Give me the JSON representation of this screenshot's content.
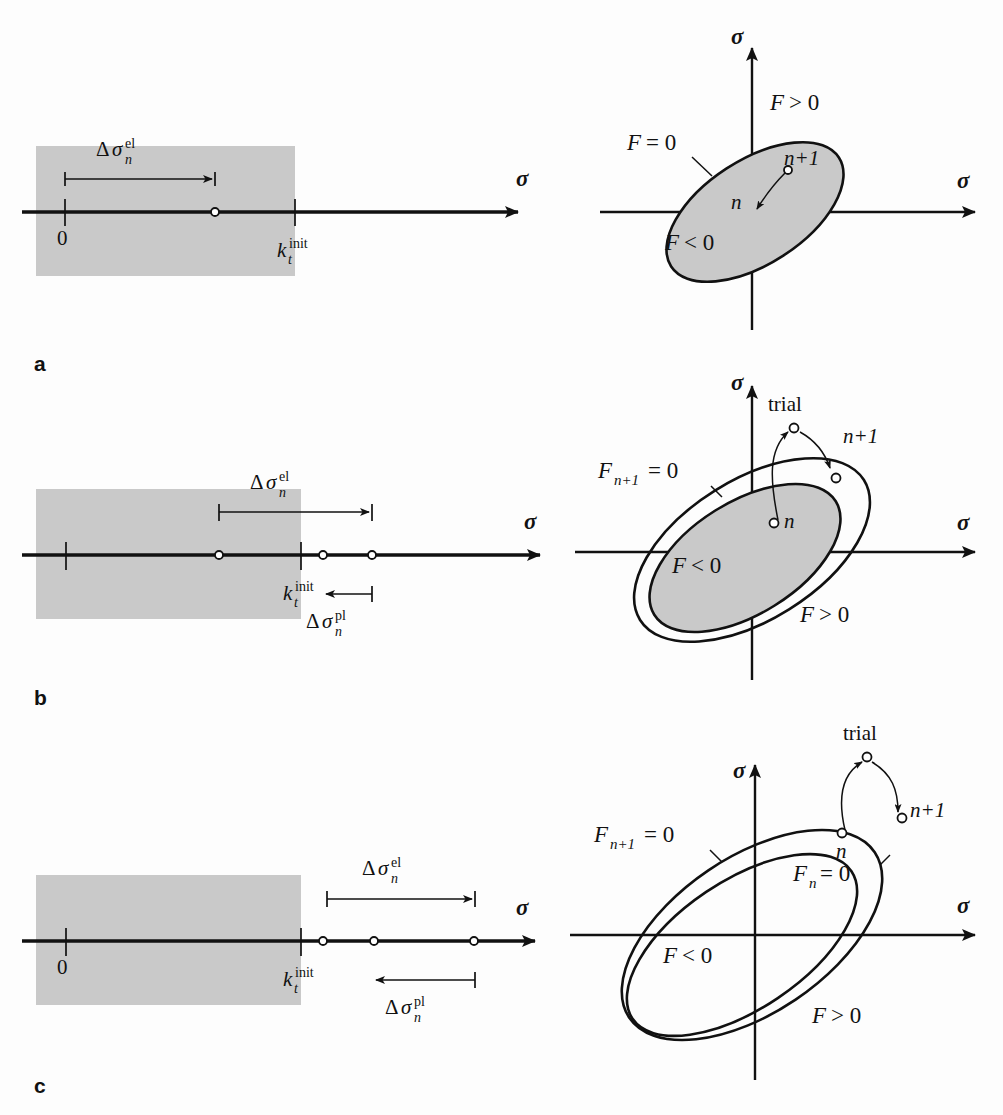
{
  "figure": {
    "background_color": "#fdfdfd",
    "shade_color": "#c9c9c9",
    "line_color": "#111111",
    "panels": [
      {
        "id": "a",
        "letter": "a",
        "left": {
          "axis_label": "σ",
          "origin_label": "0",
          "threshold_label": {
            "base": "k",
            "sub": "t",
            "sup": "init"
          },
          "increment_labels": [
            {
              "name": "elastic",
              "delta": "Δ",
              "sigma": "σ",
              "sub": "n",
              "sup": "el"
            }
          ],
          "state_points": [
            "n+1"
          ],
          "shaded_region": "elastic-domain"
        },
        "right": {
          "y_axis_label": "σ",
          "x_axis_label": "σ",
          "surface_labels": [
            "F = 0"
          ],
          "region_labels": [
            "F > 0",
            "F < 0"
          ],
          "state_labels": [
            "n",
            "n+1"
          ],
          "surfaces": 1,
          "shaded": true
        }
      },
      {
        "id": "b",
        "letter": "b",
        "left": {
          "axis_label": "σ",
          "origin_label": "",
          "threshold_label": {
            "base": "k",
            "sub": "t",
            "sup": "init"
          },
          "increment_labels": [
            {
              "name": "elastic",
              "delta": "Δ",
              "sigma": "σ",
              "sub": "n",
              "sup": "el"
            },
            {
              "name": "plastic",
              "delta": "Δ",
              "sigma": "σ",
              "sub": "n",
              "sup": "pl"
            }
          ],
          "state_points": [
            "n",
            "n+1",
            "trial"
          ],
          "shaded_region": "elastic-domain"
        },
        "right": {
          "y_axis_label": "σ",
          "x_axis_label": "σ",
          "surface_labels": [
            "F",
            "n+1",
            "= 0"
          ],
          "surface_label_text": "F_{n+1} = 0",
          "region_labels": [
            "F < 0",
            "F > 0"
          ],
          "state_labels": [
            "n",
            "n+1",
            "trial"
          ],
          "surfaces": 2,
          "shaded": true
        }
      },
      {
        "id": "c",
        "letter": "c",
        "left": {
          "axis_label": "σ",
          "origin_label": "0",
          "threshold_label": {
            "base": "k",
            "sub": "t",
            "sup": "init"
          },
          "increment_labels": [
            {
              "name": "elastic",
              "delta": "Δ",
              "sigma": "σ",
              "sub": "n",
              "sup": "el"
            },
            {
              "name": "plastic",
              "delta": "Δ",
              "sigma": "σ",
              "sub": "n",
              "sup": "pl"
            }
          ],
          "state_points": [
            "n",
            "n+1",
            "trial"
          ],
          "shaded_region": "elastic-domain"
        },
        "right": {
          "y_axis_label": "σ",
          "x_axis_label": "σ",
          "surface_labels": [
            "F_{n+1} = 0",
            "F_n = 0"
          ],
          "region_labels": [
            "F < 0",
            "F > 0"
          ],
          "state_labels": [
            "n",
            "n+1",
            "trial"
          ],
          "surfaces": 2,
          "shaded": false
        }
      }
    ],
    "glyphs": {
      "F": "F",
      "eq0": "= 0",
      "gt0": "> 0",
      "lt0": "< 0",
      "n": "n",
      "n_plus_1": "n+1",
      "trial": "trial",
      "zero": "0",
      "k": "k",
      "t": "t",
      "init": "init",
      "delta": "Δ",
      "sigma": "σ",
      "el": "el",
      "pl": "pl",
      "sub_n": "n",
      "F_sub_n": "n",
      "F_sub_np1": "n+1"
    }
  }
}
